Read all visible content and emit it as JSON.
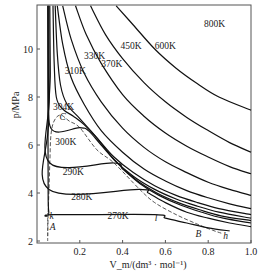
{
  "chart_data": {
    "type": "line",
    "title": "",
    "xlabel": "V_m/(dm³ · mol⁻¹)",
    "ylabel": "p/MPa",
    "xlim": [
      0,
      1.0
    ],
    "ylim": [
      2,
      11.8
    ],
    "x_ticks": [
      "0.2",
      "0.4",
      "0.6",
      "0.8",
      "1.0"
    ],
    "y_ticks": [
      "2",
      "4",
      "6",
      "8",
      "10"
    ],
    "grid": false,
    "legend": "none",
    "series": [
      {
        "name": "800K",
        "label_pos": [
          0.78,
          10.9
        ],
        "points": [
          [
            0.37,
            11.8
          ],
          [
            0.45,
            11.0
          ],
          [
            0.55,
            10.0
          ],
          [
            0.65,
            9.2
          ],
          [
            0.75,
            8.55
          ],
          [
            0.85,
            8.0
          ],
          [
            1.0,
            7.45
          ]
        ]
      },
      {
        "name": "600K",
        "label_pos": [
          0.55,
          10.0
        ],
        "points": [
          [
            0.25,
            11.8
          ],
          [
            0.32,
            10.6
          ],
          [
            0.4,
            9.6
          ],
          [
            0.5,
            8.6
          ],
          [
            0.6,
            7.8
          ],
          [
            0.7,
            7.15
          ],
          [
            0.8,
            6.6
          ],
          [
            0.9,
            6.1
          ],
          [
            1.0,
            5.7
          ]
        ]
      },
      {
        "name": "450K",
        "label_pos": [
          0.39,
          10.0
        ],
        "points": [
          [
            0.18,
            11.8
          ],
          [
            0.23,
            10.6
          ],
          [
            0.3,
            9.4
          ],
          [
            0.4,
            8.1
          ],
          [
            0.5,
            7.2
          ],
          [
            0.6,
            6.5
          ],
          [
            0.7,
            5.95
          ],
          [
            0.8,
            5.5
          ],
          [
            0.9,
            5.1
          ],
          [
            1.0,
            4.8
          ]
        ]
      },
      {
        "name": "370K",
        "label_pos": [
          0.3,
          9.25
        ],
        "points": [
          [
            0.12,
            11.8
          ],
          [
            0.16,
            10.4
          ],
          [
            0.22,
            9.0
          ],
          [
            0.3,
            7.8
          ],
          [
            0.4,
            6.7
          ],
          [
            0.5,
            5.9
          ],
          [
            0.6,
            5.3
          ],
          [
            0.7,
            4.85
          ],
          [
            0.8,
            4.45
          ],
          [
            0.9,
            4.15
          ],
          [
            1.0,
            3.9
          ]
        ]
      },
      {
        "name": "330K",
        "label_pos": [
          0.22,
          9.6
        ],
        "points": [
          [
            0.095,
            11.8
          ],
          [
            0.12,
            10.2
          ],
          [
            0.16,
            8.8
          ],
          [
            0.22,
            7.7
          ],
          [
            0.3,
            6.6
          ],
          [
            0.4,
            5.7
          ],
          [
            0.5,
            5.0
          ],
          [
            0.6,
            4.5
          ],
          [
            0.7,
            4.1
          ],
          [
            0.8,
            3.8
          ],
          [
            0.9,
            3.55
          ],
          [
            1.0,
            3.35
          ]
        ]
      },
      {
        "name": "310K",
        "label_pos": [
          0.13,
          8.95
        ],
        "points": [
          [
            0.085,
            11.8
          ],
          [
            0.095,
            9.8
          ],
          [
            0.11,
            8.5
          ],
          [
            0.14,
            7.7
          ],
          [
            0.2,
            7.1
          ],
          [
            0.28,
            6.3
          ],
          [
            0.36,
            5.5
          ],
          [
            0.45,
            4.85
          ],
          [
            0.55,
            4.3
          ],
          [
            0.65,
            3.9
          ],
          [
            0.75,
            3.6
          ],
          [
            0.85,
            3.35
          ],
          [
            1.0,
            3.1
          ]
        ]
      },
      {
        "name": "304K",
        "label_pos": [
          0.075,
          7.45
        ],
        "points": [
          [
            0.075,
            11.8
          ],
          [
            0.08,
            9.5
          ],
          [
            0.09,
            8.0
          ],
          [
            0.12,
            7.5
          ],
          [
            0.17,
            7.2
          ],
          [
            0.22,
            6.85
          ],
          [
            0.28,
            6.3
          ],
          [
            0.36,
            5.4
          ],
          [
            0.45,
            4.7
          ],
          [
            0.55,
            4.15
          ],
          [
            0.65,
            3.75
          ],
          [
            0.75,
            3.45
          ],
          [
            0.85,
            3.2
          ],
          [
            1.0,
            2.95
          ]
        ]
      },
      {
        "name": "300K",
        "label_pos": [
          0.085,
          6.0
        ],
        "points": [
          [
            0.06,
            11.8
          ],
          [
            0.062,
            9.0
          ],
          [
            0.065,
            6.7
          ],
          [
            0.2,
            6.72
          ],
          [
            0.24,
            6.6
          ],
          [
            0.3,
            6.0
          ],
          [
            0.38,
            5.2
          ],
          [
            0.47,
            4.5
          ],
          [
            0.56,
            4.0
          ],
          [
            0.66,
            3.6
          ],
          [
            0.76,
            3.3
          ],
          [
            0.86,
            3.05
          ],
          [
            1.0,
            2.85
          ]
        ]
      },
      {
        "name": "290K",
        "label_pos": [
          0.12,
          4.75
        ],
        "points": [
          [
            0.055,
            11.8
          ],
          [
            0.057,
            8.0
          ],
          [
            0.06,
            5.25
          ],
          [
            0.36,
            5.25
          ],
          [
            0.4,
            5.0
          ],
          [
            0.48,
            4.4
          ],
          [
            0.57,
            3.9
          ],
          [
            0.67,
            3.5
          ],
          [
            0.77,
            3.2
          ],
          [
            0.87,
            2.95
          ],
          [
            1.0,
            2.75
          ]
        ]
      },
      {
        "name": "280K",
        "label_pos": [
          0.16,
          3.7
        ],
        "points": [
          [
            0.052,
            11.8
          ],
          [
            0.054,
            7.0
          ],
          [
            0.056,
            4.15
          ],
          [
            0.48,
            4.15
          ],
          [
            0.52,
            4.0
          ],
          [
            0.6,
            3.6
          ],
          [
            0.7,
            3.2
          ],
          [
            0.8,
            2.95
          ],
          [
            0.9,
            2.75
          ],
          [
            1.0,
            2.6
          ]
        ]
      },
      {
        "name": "270K",
        "label_pos": [
          0.33,
          2.9
        ],
        "points": [
          [
            0.05,
            11.8
          ],
          [
            0.052,
            5.0
          ],
          [
            0.055,
            3.2
          ],
          [
            0.08,
            3.1
          ],
          [
            0.55,
            3.1
          ],
          [
            0.6,
            2.95
          ],
          [
            0.7,
            2.75
          ],
          [
            0.8,
            2.55
          ],
          [
            0.9,
            2.42
          ]
        ]
      }
    ],
    "coexistence_curve": {
      "style": "dashed",
      "points": [
        [
          0.05,
          2.2
        ],
        [
          0.052,
          3.1
        ],
        [
          0.056,
          4.15
        ],
        [
          0.06,
          5.25
        ],
        [
          0.065,
          6.4
        ],
        [
          0.08,
          7.0
        ],
        [
          0.11,
          7.25
        ],
        [
          0.15,
          7.0
        ],
        [
          0.2,
          6.72
        ],
        [
          0.28,
          5.8
        ],
        [
          0.36,
          5.25
        ],
        [
          0.48,
          4.15
        ],
        [
          0.55,
          3.6
        ],
        [
          0.65,
          3.1
        ],
        [
          0.75,
          2.7
        ],
        [
          0.82,
          2.45
        ],
        [
          0.87,
          2.3
        ]
      ]
    },
    "annotations": [
      {
        "text": "C",
        "pos": [
          0.105,
          7.05
        ]
      },
      {
        "text": "k",
        "pos": [
          0.058,
          2.9
        ]
      },
      {
        "text": "A",
        "pos": [
          0.06,
          2.45
        ]
      },
      {
        "text": "l",
        "pos": [
          0.55,
          2.85
        ]
      },
      {
        "text": "B",
        "pos": [
          0.74,
          2.15
        ]
      },
      {
        "text": "h",
        "pos": [
          0.87,
          2.1
        ]
      }
    ]
  }
}
